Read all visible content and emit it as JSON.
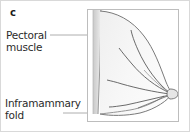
{
  "figure": {
    "panel_letter": "c",
    "labels": [
      {
        "id": "pectoral",
        "text": "Pectoral\nmuscle",
        "target": "pectoral-muscle-strip"
      },
      {
        "id": "inframammary",
        "text": "Inframammary\nfold",
        "target": "inframammary-fold-line"
      }
    ],
    "illustration": {
      "name": "lateral-breast-anatomy-diagram",
      "view": "lateral profile",
      "structures": [
        "pectoral muscle",
        "breast contour",
        "lactiferous ducts",
        "nipple",
        "inframammary fold"
      ]
    },
    "colors": {
      "outer_border": "#d9d9d9",
      "inner_frame": "#bdbdbd",
      "text": "#2b2b2b",
      "letter": "#1a1a1a",
      "leader_line": "#8c8c8c",
      "tissue_fill": "#f4f4f4",
      "muscle_fill": "#d5d5d5",
      "outline": "#6e6e6e",
      "duct": "#4d4d4d"
    }
  }
}
